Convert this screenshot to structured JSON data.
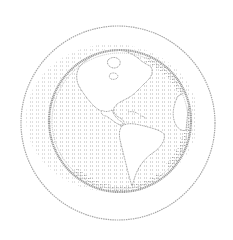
{
  "illustration": {
    "subject": "globe-icon",
    "view": "western-hemisphere",
    "continents": [
      "north-america",
      "south-america",
      "greenland"
    ],
    "style": "halftone-hatched-line-art"
  },
  "colors": {
    "background": "#ffffff",
    "line": "#9a9a9a",
    "hatch": "#b4b4b4",
    "land": "#ffffff"
  },
  "geometry": {
    "outer_ring": {
      "cx": 118,
      "cy": 123,
      "r": 97
    },
    "globe": {
      "cx": 120,
      "cy": 121,
      "r": 71
    }
  }
}
